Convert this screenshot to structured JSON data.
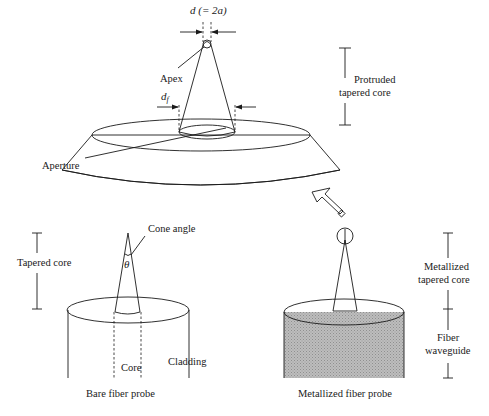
{
  "figure": {
    "top_probe": {
      "labels": {
        "diameter": "d (= 2a)",
        "apex": "Apex",
        "df": "d",
        "df_sub": "f",
        "aperture": "Aperture",
        "protruded_line1": "Protruded",
        "protruded_line2": "tapered core"
      }
    },
    "bare_probe": {
      "labels": {
        "cone_angle": "Cone angle",
        "theta": "θ",
        "tapered_core": "Tapered core",
        "core": "Core",
        "cladding": "Cladding",
        "caption": "Bare fiber probe"
      }
    },
    "metallized_probe": {
      "labels": {
        "metallized_line1": "Metallized",
        "metallized_line2": "tapered core",
        "fiber_line1": "Fiber",
        "fiber_line2": "waveguide",
        "caption": "Metallized fiber probe"
      }
    },
    "colors": {
      "fill_gray": "#b8b8b8",
      "stroke": "#1a1a1a"
    }
  }
}
